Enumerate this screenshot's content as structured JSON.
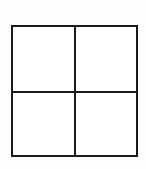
{
  "figure": {
    "type": "diagram",
    "shape_name": "quadrant-grid",
    "canvas": {
      "width": 146,
      "height": 169,
      "background_color": "#fdfdfd"
    },
    "square": {
      "x": 11,
      "y": 25,
      "width": 127,
      "height": 132,
      "fill_color": "#ffffff",
      "stroke_color": "#1a1a1a",
      "stroke_width": 2
    },
    "dividers": [
      {
        "name": "vertical-center-divider",
        "orientation": "vertical",
        "position": 75,
        "stroke_color": "#1a1a1a",
        "stroke_width": 2
      },
      {
        "name": "horizontal-center-divider",
        "orientation": "horizontal",
        "position": 92,
        "stroke_color": "#1a1a1a",
        "stroke_width": 2
      }
    ],
    "cells": [
      {
        "name": "top-left-cell",
        "label": "",
        "fill_color": "#ffffff"
      },
      {
        "name": "top-right-cell",
        "label": "",
        "fill_color": "#ffffff"
      },
      {
        "name": "bottom-left-cell",
        "label": "",
        "fill_color": "#ffffff"
      },
      {
        "name": "bottom-right-cell",
        "label": "",
        "fill_color": "#ffffff"
      }
    ]
  }
}
